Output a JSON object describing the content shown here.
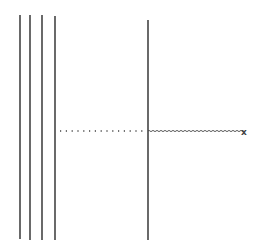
{
  "diagram": {
    "width": 257,
    "height": 252,
    "stroke_color": "#444444",
    "left_plates": [
      {
        "x": 20,
        "y1": 15,
        "y2": 239
      },
      {
        "x": 30,
        "y1": 15,
        "y2": 240
      },
      {
        "x": 42,
        "y1": 15,
        "y2": 240
      },
      {
        "x": 55,
        "y1": 16,
        "y2": 240
      }
    ],
    "right_plate": {
      "x": 148,
      "y1": 20,
      "y2": 240
    },
    "dotted_line": {
      "x1": 60,
      "x2": 146,
      "y": 131
    },
    "wavy_line": {
      "x1": 148,
      "x2": 242,
      "y": 131
    },
    "end_marker": {
      "symbol": "x",
      "x": 244,
      "y": 132
    }
  }
}
